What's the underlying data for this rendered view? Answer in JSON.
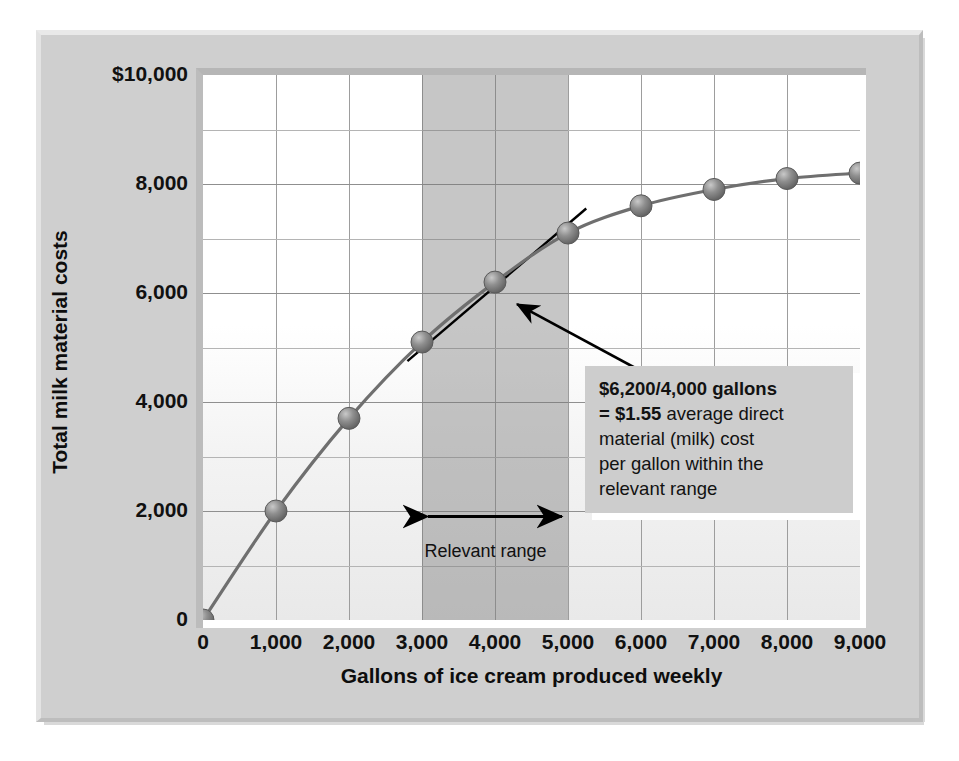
{
  "chart_data": {
    "type": "line",
    "title": "",
    "xlabel": "Gallons of ice cream produced weekly",
    "ylabel": "Total milk material costs",
    "xlim": [
      0,
      9000
    ],
    "ylim": [
      0,
      10000
    ],
    "grid": true,
    "legend": "none",
    "x_ticks": [
      "0",
      "1,000",
      "2,000",
      "3,000",
      "4,000",
      "5,000",
      "6,000",
      "7,000",
      "8,000",
      "9,000"
    ],
    "x_tick_values": [
      0,
      1000,
      2000,
      3000,
      4000,
      5000,
      6000,
      7000,
      8000,
      9000
    ],
    "y_ticks": [
      "0",
      "2,000",
      "4,000",
      "6,000",
      "8,000",
      "$10,000"
    ],
    "y_tick_values": [
      0,
      2000,
      4000,
      6000,
      8000,
      10000
    ],
    "x": [
      0,
      1000,
      2000,
      3000,
      4000,
      5000,
      6000,
      7000,
      8000,
      9000
    ],
    "values": [
      0,
      2000,
      3700,
      5100,
      6200,
      7100,
      7600,
      7900,
      8100,
      8200
    ],
    "series": [
      {
        "name": "Total milk material costs",
        "values": [
          0,
          2000,
          3700,
          5100,
          6200,
          7100,
          7600,
          7900,
          8100,
          8200
        ]
      }
    ],
    "marker": "sphere",
    "marker_color": "#7d7d7d",
    "line_color": "#6f6f6f",
    "shaded_region": {
      "label": "Relevant range",
      "x_start": 3000,
      "x_end": 5000,
      "color": "#787878"
    },
    "secant_line": {
      "from_x": 2800,
      "from_y": 4750,
      "to_x": 5250,
      "to_y": 7550
    },
    "annotations": [
      {
        "name": "average-cost-callout",
        "lines": [
          {
            "bold": "$6,200/4,000 gallons",
            "plain": ""
          },
          {
            "bold": "= $1.55",
            "plain": " average direct"
          },
          {
            "bold": "",
            "plain": "material (milk) cost"
          },
          {
            "bold": "",
            "plain": "per gallon within the"
          },
          {
            "bold": "",
            "plain": "relevant range"
          }
        ],
        "points_to_x": 4000,
        "points_to_y": 6200
      }
    ]
  },
  "axes": {
    "y_title": "Total milk material costs",
    "x_title": "Gallons of ice cream produced weekly",
    "y_tick_labels": [
      "$10,000",
      "8,000",
      "6,000",
      "4,000",
      "2,000",
      "0"
    ],
    "x_tick_labels": [
      "0",
      "1,000",
      "2,000",
      "3,000",
      "4,000",
      "5,000",
      "6,000",
      "7,000",
      "8,000",
      "9,000"
    ]
  },
  "callout": {
    "line1_bold": "$6,200/4,000 gallons",
    "line2_bold": "= $1.55",
    "line2_rest": " average direct",
    "line3": "material (milk) cost",
    "line4": "per gallon within the",
    "line5": "relevant range"
  },
  "relevant_range": {
    "label": "Relevant range"
  },
  "colors": {
    "panel": "#cfcfcf",
    "plot_background": "#ffffff",
    "band": "#787878",
    "grid": "#9d9d9d",
    "marker": "#7d7d7d",
    "line": "#6f6f6f",
    "text": "#111111",
    "callout_background": "#cdcdcd"
  }
}
